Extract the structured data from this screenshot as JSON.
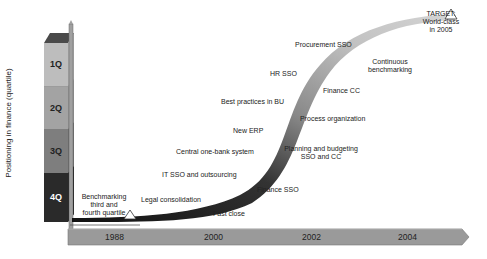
{
  "diagram": {
    "y_axis_label": "Positioning in finance (quartile)",
    "quartiles": [
      {
        "label": "1Q",
        "color": "#bdbdbd",
        "text_color": "#222222"
      },
      {
        "label": "2Q",
        "color": "#a3a3a3",
        "text_color": "#222222"
      },
      {
        "label": "3Q",
        "color": "#7e7e7e",
        "text_color": "#222222"
      },
      {
        "label": "4Q",
        "color": "#2a2a2a",
        "text_color": "#ffffff"
      }
    ],
    "timeline": {
      "years": [
        "1988",
        "2000",
        "2002",
        "2004"
      ],
      "bar_color": "#9a9a9a"
    },
    "milestones_start": {
      "label_line1": "Benchmarking",
      "label_line2": "third and",
      "label_line3": "fourth quartile"
    },
    "target": {
      "line1": "TARGET:",
      "line2": "World-class",
      "line3": "in 2005"
    },
    "upper_labels": [
      "Legal consolidation",
      "IT SSO and outsourcing",
      "Central one-bank system",
      "New ERP",
      "Best practices in BU",
      "HR SSO",
      "Procurement SSO"
    ],
    "lower_labels": [
      "Fast close",
      "Finance SSO",
      "Planning and budgeting",
      "SSO and CC",
      "Process organization",
      "Finance CC",
      "Continuous",
      "benchmarking"
    ],
    "curve_color_dark": "#111111",
    "curve_color_light": "#c8c8c8"
  }
}
